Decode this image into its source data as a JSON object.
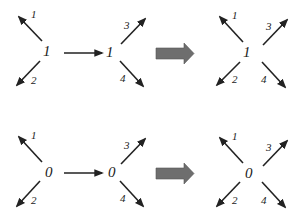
{
  "diagram": {
    "rows": [
      {
        "id": "row-1",
        "vertex_value": "1",
        "left": {
          "vertex_label": "1",
          "legs": [
            {
              "label": "1",
              "direction": "up-left"
            },
            {
              "label": "2",
              "direction": "down-left"
            }
          ]
        },
        "middle": {
          "vertex_label": "1",
          "legs": [
            {
              "label": "3",
              "direction": "up-right"
            },
            {
              "label": "4",
              "direction": "down-right"
            }
          ]
        },
        "right": {
          "vertex_label": "1",
          "legs": [
            {
              "label": "1",
              "direction": "up-left"
            },
            {
              "label": "2",
              "direction": "down-left"
            },
            {
              "label": "3",
              "direction": "up-right"
            },
            {
              "label": "4",
              "direction": "down-right"
            }
          ]
        }
      },
      {
        "id": "row-2",
        "vertex_value": "0",
        "left": {
          "vertex_label": "0",
          "legs": [
            {
              "label": "1",
              "direction": "up-left"
            },
            {
              "label": "2",
              "direction": "down-left"
            }
          ]
        },
        "middle": {
          "vertex_label": "0",
          "legs": [
            {
              "label": "3",
              "direction": "up-right"
            },
            {
              "label": "4",
              "direction": "down-right"
            }
          ]
        },
        "right": {
          "vertex_label": "0",
          "legs": [
            {
              "label": "1",
              "direction": "up-left"
            },
            {
              "label": "2",
              "direction": "down-left"
            },
            {
              "label": "3",
              "direction": "up-right"
            },
            {
              "label": "4",
              "direction": "down-right"
            }
          ]
        }
      }
    ],
    "colors": {
      "line": "#222222",
      "block_arrow": "#6e6e6e"
    }
  }
}
